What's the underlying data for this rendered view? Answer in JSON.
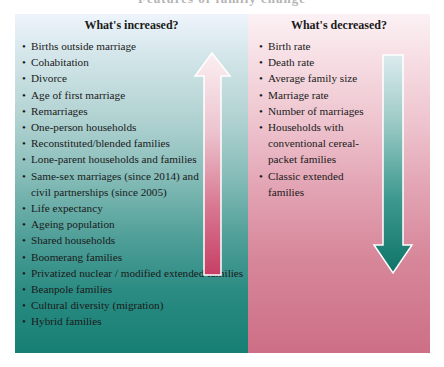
{
  "title": "Features of family change",
  "colors": {
    "increase_panel_top": "#eef4fb",
    "increase_panel_bottom": "#177f74",
    "decrease_panel_top": "#fbf1f4",
    "decrease_panel_bottom": "#cd6f86",
    "up_arrow_top": "#fbeff2",
    "up_arrow_bottom": "#c63f64",
    "down_arrow_top": "#dcebee",
    "down_arrow_bottom": "#0f7468"
  },
  "increased": {
    "heading": "What's increased?",
    "arrow": "up-arrow",
    "items": [
      {
        "bullet": "•",
        "text": "Births outside marriage"
      },
      {
        "bullet": "•",
        "text": "Cohabitation"
      },
      {
        "bullet": "•",
        "text": "Divorce"
      },
      {
        "bullet": "•",
        "text": "Age of first marriage"
      },
      {
        "bullet": "•",
        "text": "Remarriages"
      },
      {
        "bullet": "•",
        "text": "One-person households"
      },
      {
        "bullet": "•",
        "text": "Reconstituted/blended families"
      },
      {
        "bullet": "•",
        "text": "Lone-parent households and families"
      },
      {
        "bullet": "•",
        "text": "Same-sex marriages (since 2014) and civil partnerships (since 2005)"
      },
      {
        "bullet": "•",
        "text": "Life expectancy"
      },
      {
        "bullet": "•",
        "text": "Ageing population"
      },
      {
        "bullet": "•",
        "text": "Shared households"
      },
      {
        "bullet": "•",
        "text": "Boomerang families"
      },
      {
        "bullet": "•",
        "text": "Privatized nuclear / modified extended families"
      },
      {
        "bullet": "•",
        "text": "Beanpole families"
      },
      {
        "bullet": "•",
        "text": "Cultural diversity (migration)"
      },
      {
        "bullet": "•",
        "text": "Hybrid families"
      }
    ]
  },
  "decreased": {
    "heading": "What's decreased?",
    "arrow": "down-arrow",
    "items": [
      {
        "bullet": "•",
        "text": "Birth rate"
      },
      {
        "bullet": "•",
        "text": "Death rate"
      },
      {
        "bullet": "•",
        "text": "Average family size"
      },
      {
        "bullet": "•",
        "text": "Marriage rate"
      },
      {
        "bullet": "•",
        "text": "Number of marriages"
      },
      {
        "bullet": "•",
        "text": "Households with conventional cereal-packet families"
      },
      {
        "bullet": "•",
        "text": "Classic extended families"
      }
    ]
  }
}
